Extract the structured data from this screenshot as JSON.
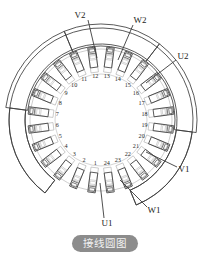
{
  "figure": {
    "caption": "接线圆图",
    "caption_color": "#8c8c8c",
    "background": "#ffffff",
    "ink_dark": "#3c3c3c",
    "ink_light": "#b9b9b9"
  },
  "diagram": {
    "type": "motor-winding-connection-circle",
    "slot_count": 24,
    "slot_numbers": [
      "1",
      "2",
      "3",
      "4",
      "5",
      "6",
      "7",
      "8",
      "9",
      "10",
      "11",
      "12",
      "13",
      "14",
      "15",
      "16",
      "17",
      "18",
      "19",
      "20",
      "21",
      "22",
      "23",
      "24"
    ],
    "center": {
      "x": 101,
      "y": 120
    },
    "radii": {
      "number_ring": 44,
      "coil_inner": 50,
      "coil_outer": 70,
      "arc_inner": 74,
      "arc_outer": 96
    },
    "terminals": [
      {
        "name": "V2",
        "x": 80,
        "y": 16,
        "lead_from_slot": 14,
        "lead": {
          "x1": 88,
          "y1": 20,
          "x2": 97,
          "y2": 58
        }
      },
      {
        "name": "W2",
        "x": 140,
        "y": 21,
        "lead_from_slot": 11,
        "lead": {
          "x1": 133,
          "y1": 25,
          "x2": 118,
          "y2": 60
        }
      },
      {
        "name": "U2",
        "x": 183,
        "y": 57,
        "lead_from_slot": 9,
        "lead": {
          "x1": 176,
          "y1": 60,
          "x2": 146,
          "y2": 83
        }
      },
      {
        "name": "V1",
        "x": 184,
        "y": 170,
        "lead_from_slot": 4,
        "lead": {
          "x1": 177,
          "y1": 167,
          "x2": 146,
          "y2": 152
        }
      },
      {
        "name": "W1",
        "x": 154,
        "y": 211,
        "lead_from_slot": 2,
        "lead": {
          "x1": 147,
          "y1": 207,
          "x2": 120,
          "y2": 180
        }
      },
      {
        "name": "U1",
        "x": 107,
        "y": 224,
        "lead_from_slot": 24,
        "lead": {
          "x1": 104,
          "y1": 218,
          "x2": 100,
          "y2": 183
        }
      }
    ],
    "number_ring_labels_clockwise_from_bottom": [
      "1",
      "2",
      "3",
      "4",
      "5",
      "6",
      "7",
      "8",
      "9",
      "10",
      "11",
      "12",
      "13",
      "14",
      "15",
      "16",
      "17",
      "18",
      "19",
      "20",
      "21",
      "22",
      "23",
      "24"
    ],
    "outer_arcs": [
      {
        "name": "arc-left-upper",
        "start_slot": 15,
        "end_slot": 19
      },
      {
        "name": "arc-left-lower",
        "start_slot": 19,
        "end_slot": 23
      },
      {
        "name": "arc-right-upper",
        "start_slot": 7,
        "end_slot": 11
      },
      {
        "name": "arc-right-lower",
        "start_slot": 3,
        "end_slot": 7
      },
      {
        "name": "arc-top",
        "start_slot": 11,
        "end_slot": 15
      },
      {
        "name": "arc-bottom",
        "start_slot": 23,
        "end_slot": 3
      }
    ]
  }
}
